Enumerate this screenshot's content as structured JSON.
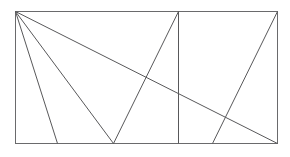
{
  "figure": {
    "kind": "geometry-diagram",
    "canvas": {
      "width": 290,
      "height": 157,
      "background": "#ffffff"
    },
    "style": {
      "line_color": "#58585a",
      "border_color": "#6a6a6c",
      "fill_color": "#ffffff",
      "line_width": 1
    },
    "rectangle": {
      "label": "outer-rectangle",
      "x": 15,
      "y": 11,
      "width": 262,
      "height": 132,
      "corners": {
        "top_left": [
          15,
          11
        ],
        "top_right": [
          277,
          11
        ],
        "bottom_right": [
          277,
          143
        ],
        "bottom_left": [
          15,
          143
        ]
      }
    },
    "segments": [
      {
        "name": "fan-line-1",
        "from": [
          15,
          11
        ],
        "to": [
          57,
          143
        ]
      },
      {
        "name": "fan-line-2",
        "from": [
          15,
          11
        ],
        "to": [
          113,
          143
        ]
      },
      {
        "name": "main-diagonal",
        "from": [
          15,
          11
        ],
        "to": [
          277,
          143
        ]
      },
      {
        "name": "v-right-arm",
        "from": [
          113,
          143
        ],
        "to": [
          178,
          11
        ]
      },
      {
        "name": "vertical-divider",
        "from": [
          178,
          11
        ],
        "to": [
          178,
          143
        ]
      },
      {
        "name": "right-diagonal",
        "from": [
          277,
          11
        ],
        "to": [
          212,
          143
        ]
      }
    ],
    "vertices": [
      {
        "name": "apex-top-left",
        "x": 15,
        "y": 11
      },
      {
        "name": "top-divider-point",
        "x": 178,
        "y": 11
      },
      {
        "name": "top-right-corner",
        "x": 277,
        "y": 11
      },
      {
        "name": "bottom-point-a",
        "x": 57,
        "y": 143
      },
      {
        "name": "v-apex-bottom",
        "x": 113,
        "y": 143
      },
      {
        "name": "bottom-divider-point",
        "x": 178,
        "y": 143
      },
      {
        "name": "bottom-point-b",
        "x": 212,
        "y": 143
      },
      {
        "name": "bottom-right-corner",
        "x": 277,
        "y": 143
      },
      {
        "name": "bottom-left-corner",
        "x": 15,
        "y": 143
      }
    ]
  }
}
